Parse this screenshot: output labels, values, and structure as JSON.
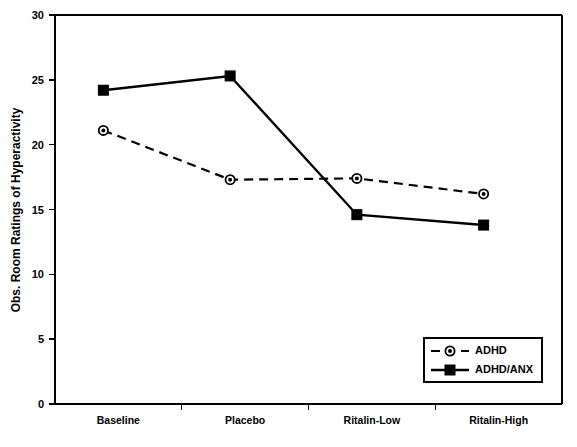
{
  "chart_data": {
    "type": "line",
    "title": "",
    "subtitle": "",
    "xlabel": "",
    "ylabel": "Obs. Room Ratings of Hyperactivity",
    "categories": [
      "Baseline",
      "Placebo",
      "Ritalin-Low",
      "Ritalin-High"
    ],
    "ylim": [
      0,
      30
    ],
    "yticks": [
      0,
      5,
      10,
      15,
      20,
      25,
      30
    ],
    "ytick_labels": [
      "0",
      "5",
      "10",
      "15",
      "20",
      "25",
      "30"
    ],
    "grid": false,
    "legend_position": "bottom-right",
    "series": [
      {
        "name": "ADHD",
        "values": [
          21.1,
          17.3,
          17.4,
          16.2
        ],
        "marker": "circle",
        "line_style": "dashed",
        "color": "#000000"
      },
      {
        "name": "ADHD/ANX",
        "values": [
          24.2,
          25.3,
          14.6,
          13.8
        ],
        "marker": "square",
        "line_style": "solid",
        "color": "#000000"
      }
    ],
    "legend_entries": [
      {
        "label": "ADHD",
        "marker": "circle",
        "line_style": "dashed"
      },
      {
        "label": "ADHD/ANX",
        "marker": "square",
        "line_style": "solid"
      }
    ]
  }
}
